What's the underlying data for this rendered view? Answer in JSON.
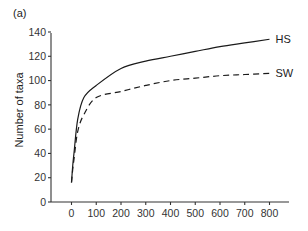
{
  "panel_label": "(a)",
  "chart_data": {
    "type": "line",
    "title": "",
    "xlabel": "",
    "ylabel": "Number of taxa",
    "xlim": [
      -40,
      880
    ],
    "ylim": [
      0,
      140
    ],
    "x_ticks": [
      0,
      100,
      200,
      300,
      400,
      500,
      600,
      700,
      800
    ],
    "y_ticks": [
      0,
      20,
      40,
      60,
      80,
      100,
      120,
      140
    ],
    "grid": false,
    "legend": "inline labels at line ends",
    "series": [
      {
        "name": "HS",
        "style": "solid",
        "x": [
          0,
          5,
          10,
          25,
          50,
          100,
          200,
          300,
          400,
          500,
          600,
          700,
          800
        ],
        "values": [
          16,
          30,
          40,
          68,
          86,
          96,
          110,
          116,
          120,
          124,
          128,
          131,
          134
        ]
      },
      {
        "name": "SW",
        "style": "dashed",
        "x": [
          0,
          5,
          10,
          25,
          50,
          100,
          200,
          300,
          400,
          500,
          600,
          700,
          800
        ],
        "values": [
          16,
          27,
          35,
          58,
          72,
          86,
          91,
          96,
          100,
          102,
          104,
          105,
          106
        ]
      }
    ]
  },
  "layout": {
    "x0_px": 71.5,
    "px_per_x": 0.2475,
    "y0_px": 202,
    "px_per_y": 1.2143,
    "axis_left_px": 51,
    "axis_right_px": 289,
    "axis_top_px": 33
  }
}
